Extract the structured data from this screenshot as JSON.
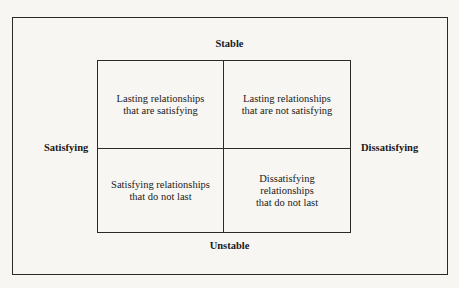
{
  "axes": {
    "top": "Stable",
    "bottom": "Unstable",
    "left": "Satisfying",
    "right": "Dissatisfying"
  },
  "quadrants": {
    "top_left": [
      "Lasting relationships",
      "that are satisfying"
    ],
    "top_right": [
      "Lasting relationships",
      "that are not satisfying"
    ],
    "bottom_left": [
      "Satisfying relationships",
      "that do not last"
    ],
    "bottom_right": [
      "Dissatisfying",
      "relationships",
      "that do not last"
    ]
  }
}
